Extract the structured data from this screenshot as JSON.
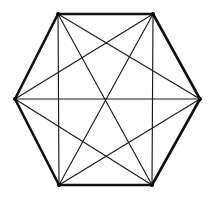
{
  "figure": {
    "shape_name": "regular-hexagon",
    "background_color": "#ffffff",
    "canvas": {
      "width": 210,
      "height": 198
    },
    "vertex_count": 6,
    "edge_count": 15,
    "perimeter_edge_count": 6,
    "chord_edge_count": 9,
    "perimeter_color": "#111111",
    "chord_color": "#1a1a1a",
    "perimeter_stroke_width": 2.6,
    "chord_stroke_width": 1.15,
    "vertices": [
      {
        "id": "top-left",
        "label": "A",
        "x": 58,
        "y": 14
      },
      {
        "id": "top-right",
        "label": "B",
        "x": 153,
        "y": 14
      },
      {
        "id": "right",
        "label": "C",
        "x": 200,
        "y": 99
      },
      {
        "id": "bottom-right",
        "label": "D",
        "x": 152,
        "y": 185
      },
      {
        "id": "bottom-left",
        "label": "E",
        "x": 59,
        "y": 185
      },
      {
        "id": "left",
        "label": "F",
        "x": 15,
        "y": 99
      }
    ],
    "perimeter_edges": [
      {
        "from": 0,
        "to": 1,
        "name": "edge-top"
      },
      {
        "from": 1,
        "to": 2,
        "name": "edge-upper-right"
      },
      {
        "from": 2,
        "to": 3,
        "name": "edge-lower-right"
      },
      {
        "from": 3,
        "to": 4,
        "name": "edge-bottom"
      },
      {
        "from": 4,
        "to": 5,
        "name": "edge-lower-left"
      },
      {
        "from": 5,
        "to": 0,
        "name": "edge-upper-left"
      }
    ],
    "chord_edges": [
      {
        "from": 0,
        "to": 2,
        "name": "chord-top-left-to-right"
      },
      {
        "from": 0,
        "to": 3,
        "name": "chord-top-left-to-bottom-right"
      },
      {
        "from": 0,
        "to": 4,
        "name": "chord-top-left-to-bottom-left"
      },
      {
        "from": 1,
        "to": 3,
        "name": "chord-top-right-to-bottom-right"
      },
      {
        "from": 1,
        "to": 4,
        "name": "chord-top-right-to-bottom-left"
      },
      {
        "from": 1,
        "to": 5,
        "name": "chord-top-right-to-left"
      },
      {
        "from": 2,
        "to": 4,
        "name": "chord-right-to-bottom-left"
      },
      {
        "from": 2,
        "to": 5,
        "name": "chord-right-to-left"
      },
      {
        "from": 3,
        "to": 5,
        "name": "chord-bottom-right-to-left"
      }
    ]
  }
}
